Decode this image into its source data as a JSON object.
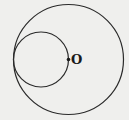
{
  "diagram": {
    "type": "geometry",
    "background": "#efefed",
    "stroke_color": "#2a2a2a",
    "large_circle": {
      "cx": 68.5,
      "cy": 59.5,
      "r": 55
    },
    "small_circle": {
      "cx": 41,
      "cy": 59.5,
      "r": 27.5
    },
    "point": {
      "label": "O",
      "x": 68.5,
      "y": 59.5
    }
  }
}
